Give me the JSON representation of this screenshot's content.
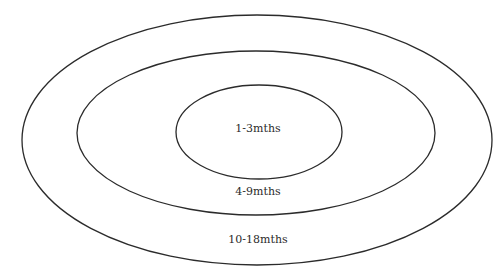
{
  "diagram": {
    "type": "concentric-ellipses",
    "stroke_color": "#2b2b2b",
    "background": "#ffffff",
    "rings": [
      {
        "name": "outer",
        "label": "10-18mths",
        "cx": 257,
        "cy": 140,
        "rx": 235,
        "ry": 125,
        "label_x": 258,
        "label_y": 240
      },
      {
        "name": "middle",
        "label": "4-9mths",
        "cx": 256,
        "cy": 133,
        "rx": 179,
        "ry": 82,
        "label_x": 258,
        "label_y": 192
      },
      {
        "name": "inner",
        "label": "1-3mths",
        "cx": 259,
        "cy": 132,
        "rx": 83,
        "ry": 47,
        "label_x": 258,
        "label_y": 129
      }
    ]
  }
}
